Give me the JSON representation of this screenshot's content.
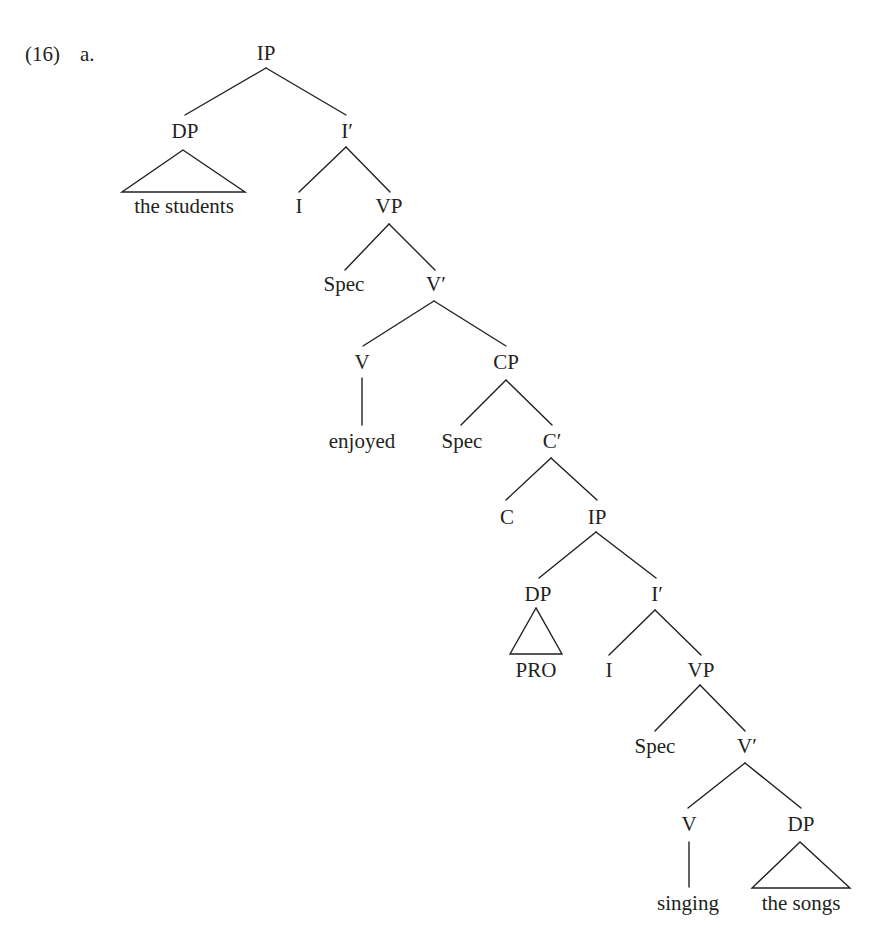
{
  "example": {
    "number": "(16)",
    "sub": "a."
  },
  "tree": {
    "nodes": [
      {
        "id": "ip1",
        "label": "IP",
        "x": 266,
        "y": 60
      },
      {
        "id": "dp1",
        "label": "DP",
        "x": 185,
        "y": 138
      },
      {
        "id": "ibar1",
        "label": "I′",
        "x": 347,
        "y": 138
      },
      {
        "id": "dp1-text",
        "label": "the students",
        "x": 184,
        "y": 213
      },
      {
        "id": "i1",
        "label": "I",
        "x": 299,
        "y": 213
      },
      {
        "id": "vp1",
        "label": "VP",
        "x": 389,
        "y": 213
      },
      {
        "id": "spec1",
        "label": "Spec",
        "x": 344,
        "y": 291
      },
      {
        "id": "vbar1",
        "label": "V′",
        "x": 436,
        "y": 291
      },
      {
        "id": "v1",
        "label": "V",
        "x": 362,
        "y": 369
      },
      {
        "id": "cp1",
        "label": "CP",
        "x": 506,
        "y": 369
      },
      {
        "id": "v1-text",
        "label": "enjoyed",
        "x": 362,
        "y": 448
      },
      {
        "id": "spec2",
        "label": "Spec",
        "x": 462,
        "y": 448
      },
      {
        "id": "cbar1",
        "label": "C′",
        "x": 552,
        "y": 448
      },
      {
        "id": "c1",
        "label": "C",
        "x": 507,
        "y": 524
      },
      {
        "id": "ip2",
        "label": "IP",
        "x": 597,
        "y": 524
      },
      {
        "id": "dp2",
        "label": "DP",
        "x": 538,
        "y": 601
      },
      {
        "id": "ibar2",
        "label": "I′",
        "x": 657,
        "y": 601
      },
      {
        "id": "dp2-text",
        "label": "PRO",
        "x": 536,
        "y": 677
      },
      {
        "id": "i2",
        "label": "I",
        "x": 609,
        "y": 677
      },
      {
        "id": "vp2",
        "label": "VP",
        "x": 701,
        "y": 677
      },
      {
        "id": "spec3",
        "label": "Spec",
        "x": 655,
        "y": 753
      },
      {
        "id": "vbar2",
        "label": "V′",
        "x": 747,
        "y": 753
      },
      {
        "id": "v2",
        "label": "V",
        "x": 689,
        "y": 831
      },
      {
        "id": "dp3",
        "label": "DP",
        "x": 801,
        "y": 831
      },
      {
        "id": "v2-text",
        "label": "singing",
        "x": 688,
        "y": 910
      },
      {
        "id": "dp3-text",
        "label": "the songs",
        "x": 801,
        "y": 910
      }
    ],
    "edges": [
      {
        "from": "IP",
        "to": "DP",
        "x1": 266,
        "y1": 68,
        "x2": 185,
        "y2": 115
      },
      {
        "from": "IP",
        "to": "I′",
        "x1": 266,
        "y1": 68,
        "x2": 346,
        "y2": 115
      },
      {
        "from": "I′",
        "to": "I",
        "x1": 346,
        "y1": 147,
        "x2": 299,
        "y2": 192
      },
      {
        "from": "I′",
        "to": "VP",
        "x1": 346,
        "y1": 147,
        "x2": 390,
        "y2": 192
      },
      {
        "from": "VP",
        "to": "Spec",
        "x1": 389,
        "y1": 224,
        "x2": 345,
        "y2": 270
      },
      {
        "from": "VP",
        "to": "V′",
        "x1": 389,
        "y1": 224,
        "x2": 435,
        "y2": 270
      },
      {
        "from": "V′",
        "to": "V",
        "x1": 434,
        "y1": 301,
        "x2": 363,
        "y2": 346
      },
      {
        "from": "V′",
        "to": "CP",
        "x1": 434,
        "y1": 301,
        "x2": 506,
        "y2": 346
      },
      {
        "from": "V",
        "to": "enjoyed",
        "x1": 362,
        "y1": 378,
        "x2": 362,
        "y2": 425
      },
      {
        "from": "CP",
        "to": "Spec",
        "x1": 506,
        "y1": 380,
        "x2": 461,
        "y2": 425
      },
      {
        "from": "CP",
        "to": "C′",
        "x1": 506,
        "y1": 380,
        "x2": 552,
        "y2": 425
      },
      {
        "from": "C′",
        "to": "C",
        "x1": 551,
        "y1": 458,
        "x2": 506,
        "y2": 500
      },
      {
        "from": "C′",
        "to": "IP",
        "x1": 551,
        "y1": 458,
        "x2": 597,
        "y2": 500
      },
      {
        "from": "IP",
        "to": "DP",
        "x1": 596,
        "y1": 532,
        "x2": 539,
        "y2": 578
      },
      {
        "from": "IP",
        "to": "I′",
        "x1": 596,
        "y1": 532,
        "x2": 656,
        "y2": 578
      },
      {
        "from": "I′",
        "to": "I",
        "x1": 655,
        "y1": 610,
        "x2": 609,
        "y2": 655
      },
      {
        "from": "I′",
        "to": "VP",
        "x1": 655,
        "y1": 610,
        "x2": 701,
        "y2": 655
      },
      {
        "from": "VP",
        "to": "Spec",
        "x1": 700,
        "y1": 685,
        "x2": 655,
        "y2": 731
      },
      {
        "from": "VP",
        "to": "V′",
        "x1": 700,
        "y1": 685,
        "x2": 745,
        "y2": 731
      },
      {
        "from": "V′",
        "to": "V",
        "x1": 745,
        "y1": 763,
        "x2": 688,
        "y2": 808
      },
      {
        "from": "V′",
        "to": "DP",
        "x1": 745,
        "y1": 763,
        "x2": 801,
        "y2": 808
      },
      {
        "from": "V",
        "to": "singing",
        "x1": 689,
        "y1": 842,
        "x2": 689,
        "y2": 887
      }
    ],
    "triangles": [
      {
        "node": "DP",
        "covers": "the students",
        "points": "183,150 122,192 245,192"
      },
      {
        "node": "DP",
        "covers": "PRO",
        "points": "536,608 510,654 562,654"
      },
      {
        "node": "DP",
        "covers": "the songs",
        "points": "800,842 752,888 850,888"
      }
    ]
  }
}
